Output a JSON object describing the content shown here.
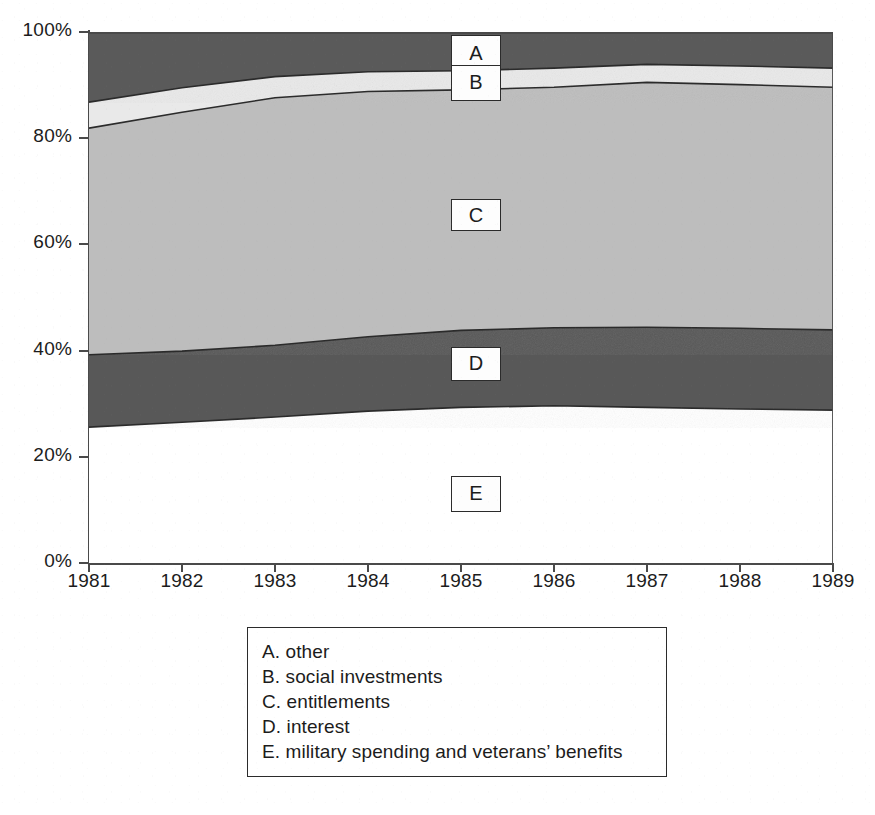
{
  "chart_data": {
    "type": "area",
    "stacked": true,
    "normalized": true,
    "title": "",
    "subtitle": "",
    "xlabel": "",
    "ylabel": "",
    "x": [
      1981,
      1982,
      1983,
      1984,
      1985,
      1986,
      1987,
      1988,
      1989
    ],
    "xtick_labels": [
      "1981",
      "1982",
      "1983",
      "1984",
      "1985",
      "1986",
      "1987",
      "1988",
      "1989"
    ],
    "ytick_labels": [
      "0%",
      "20%",
      "40%",
      "60%",
      "80%",
      "100%"
    ],
    "ytick_values": [
      0,
      20,
      40,
      60,
      80,
      100
    ],
    "ylim": [
      0,
      100
    ],
    "xlim": [
      1981,
      1989
    ],
    "grid": false,
    "legend_position": "below-plot",
    "series": [
      {
        "key": "E",
        "name": "military spending and veterans' benefits",
        "color": "#ffffff",
        "values": [
          25.6,
          26.5,
          27.5,
          28.6,
          29.3,
          29.6,
          29.3,
          29.0,
          28.8
        ]
      },
      {
        "key": "D",
        "name": "interest",
        "color": "#585858",
        "values": [
          13.6,
          13.4,
          13.5,
          14.0,
          14.5,
          14.7,
          15.1,
          15.2,
          15.1
        ]
      },
      {
        "key": "C",
        "name": "entitlements",
        "color": "#bdbdbd",
        "values": [
          42.7,
          45.0,
          46.6,
          46.2,
          45.3,
          45.3,
          46.1,
          45.9,
          45.7
        ]
      },
      {
        "key": "B",
        "name": "social investments",
        "color": "#e9e9e9",
        "values": [
          4.9,
          4.6,
          4.0,
          3.7,
          3.6,
          3.6,
          3.4,
          3.5,
          3.6
        ]
      },
      {
        "key": "A",
        "name": "other",
        "color": "#5a5a5a",
        "values": [
          13.2,
          10.5,
          8.4,
          7.5,
          7.3,
          6.8,
          6.1,
          6.4,
          6.8
        ]
      }
    ],
    "cumulative_upper_boundaries": {
      "E": [
        25.6,
        26.5,
        27.5,
        28.6,
        29.3,
        29.6,
        29.3,
        29.0,
        28.8
      ],
      "D": [
        39.2,
        39.9,
        41.0,
        42.6,
        43.8,
        44.3,
        44.4,
        44.2,
        43.9
      ],
      "C": [
        81.9,
        84.9,
        87.6,
        88.8,
        89.1,
        89.6,
        90.5,
        90.1,
        89.6
      ],
      "B": [
        86.8,
        89.5,
        91.6,
        92.5,
        92.7,
        93.2,
        93.9,
        93.6,
        93.2
      ],
      "A": [
        100,
        100,
        100,
        100,
        100,
        100,
        100,
        100,
        100
      ]
    },
    "annotations": [
      {
        "key": "A",
        "label": "A",
        "x_pct": 52.0,
        "y_pct": 96.0
      },
      {
        "key": "B",
        "label": "B",
        "x_pct": 52.0,
        "y_pct": 90.4
      },
      {
        "key": "C",
        "label": "C",
        "x_pct": 52.0,
        "y_pct": 65.5
      },
      {
        "key": "D",
        "label": "D",
        "x_pct": 52.0,
        "y_pct": 37.5
      },
      {
        "key": "E",
        "label": "E",
        "x_pct": 52.0,
        "y_pct": 13.0
      }
    ]
  },
  "axis": {
    "y_ticks": [
      {
        "label": "100%",
        "value": 100
      },
      {
        "label": "80%",
        "value": 80
      },
      {
        "label": "60%",
        "value": 60
      },
      {
        "label": "40%",
        "value": 40
      },
      {
        "label": "20%",
        "value": 20
      },
      {
        "label": "0%",
        "value": 0
      }
    ],
    "x_ticks": [
      {
        "label": "1981",
        "value": 1981
      },
      {
        "label": "1982",
        "value": 1982
      },
      {
        "label": "1983",
        "value": 1983
      },
      {
        "label": "1984",
        "value": 1984
      },
      {
        "label": "1985",
        "value": 1985
      },
      {
        "label": "1986",
        "value": 1986
      },
      {
        "label": "1987",
        "value": 1987
      },
      {
        "label": "1988",
        "value": 1988
      },
      {
        "label": "1989",
        "value": 1989
      }
    ]
  },
  "series_tags": {
    "a": "A",
    "b": "B",
    "c": "C",
    "d": "D",
    "e": "E"
  },
  "legend": {
    "items": [
      {
        "key": "A",
        "text": "A. other"
      },
      {
        "key": "B",
        "text": "B. social investments"
      },
      {
        "key": "C",
        "text": "C. entitlements"
      },
      {
        "key": "D",
        "text": "D. interest"
      },
      {
        "key": "E",
        "text": "E. military spending and veterans’ benefits"
      }
    ]
  },
  "colors": {
    "band_a": "#5a5a5a",
    "band_b": "#e9e9e9",
    "band_c": "#bdbdbd",
    "band_d": "#585858",
    "band_e": "#ffffff",
    "outline": "#2b2b2b",
    "axis": "#4a4a4a",
    "text": "#1c1c1c"
  }
}
